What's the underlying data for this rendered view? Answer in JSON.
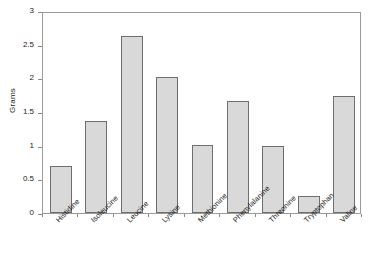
{
  "chart_data": {
    "type": "bar",
    "title": "",
    "xlabel": "",
    "ylabel": "Grams",
    "ylim": [
      0,
      3
    ],
    "yticks": [
      "0",
      "0.5",
      "1",
      "1.5",
      "2",
      "2.5",
      "3"
    ],
    "ytick_values": [
      0,
      0.5,
      1,
      1.5,
      2,
      2.5,
      3
    ],
    "grid": false,
    "legend": "none",
    "categories": [
      "Histidine",
      "Isoleucine",
      "Leucine",
      "Lysine",
      "Methionine",
      "Phenylalanine",
      "Threonine",
      "Tryptophan",
      "Valine"
    ],
    "values": [
      0.7,
      1.37,
      2.63,
      2.02,
      1.01,
      1.66,
      1.0,
      0.25,
      1.74
    ],
    "bar_fill_color": "#d9d9d9",
    "bar_border_color": "#6e6e6e",
    "axis_color": "#9a9a9a",
    "text_color": "#1a1a1a"
  }
}
